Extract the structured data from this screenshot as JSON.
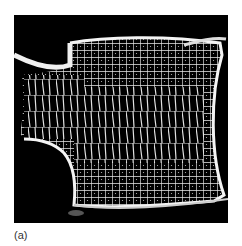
{
  "figure": {
    "panel_label": "(a)",
    "image_description": "Micro-CT image of vertebral body trabecular bone structure (white on black)",
    "colors": {
      "background": "#000000",
      "bone": "#f2f2f2",
      "page": "#ffffff"
    }
  }
}
